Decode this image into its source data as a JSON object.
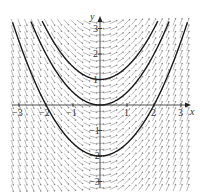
{
  "chart_data": {
    "type": "slope-field",
    "title": "",
    "differential_equation": "dy/dx = x",
    "xlabel": "x",
    "ylabel": "y",
    "xlim": [
      -3.3,
      3.3
    ],
    "ylim": [
      -3.3,
      3.3
    ],
    "x_ticks": [
      -3,
      -2,
      -1,
      1,
      2,
      3
    ],
    "x_tick_labels": [
      "−3",
      "−2",
      "−1",
      "1",
      "2",
      "3"
    ],
    "y_ticks": [
      -3,
      -2,
      -1,
      1,
      2,
      3
    ],
    "y_tick_labels": [
      "−3",
      "−2",
      "−1",
      "1",
      "2",
      "3"
    ],
    "field_spacing": 0.25,
    "solution_curves": [
      {
        "name": "y = x²/2 + 1",
        "C": 1
      },
      {
        "name": "y = x²/2",
        "C": 0
      },
      {
        "name": "y = x²/2 − 2",
        "C": -2
      }
    ],
    "grid": false,
    "colors": {
      "field": "#8a8a8a",
      "curve": "#1a1a1a",
      "axis": "#222222"
    }
  }
}
